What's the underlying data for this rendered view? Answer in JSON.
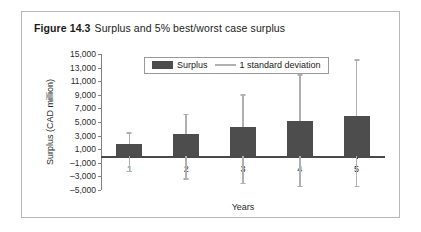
{
  "figure": {
    "number": "Figure 14.3",
    "title": "Surplus and 5% best/worst case surplus"
  },
  "colors": {
    "bar_fill": "#4d4d4d",
    "error_bar": "#b0b0b0",
    "axis": "#4a4a4a",
    "panel_border": "#b9b9b9",
    "text": "#1a1a1a"
  },
  "chart_data": {
    "type": "bar",
    "title": "Surplus and 5% best/worst case surplus",
    "xlabel": "Years",
    "ylabel": "Surplus (CAD million)",
    "categories": [
      "1",
      "2",
      "3",
      "4",
      "5"
    ],
    "ylim": [
      -5000,
      15000
    ],
    "ytick_labels": [
      "15,000",
      "13,000",
      "11,000",
      "9,000",
      "7,000",
      "5,000",
      "3,000",
      "1,000",
      "–1,000",
      "–3,000",
      "–5,000"
    ],
    "ytick_values": [
      15000,
      13000,
      11000,
      9000,
      7000,
      5000,
      3000,
      1000,
      -1000,
      -3000,
      -5000
    ],
    "ytick_step": 2000,
    "grid": false,
    "legend_position": "top-center",
    "series": [
      {
        "name": "Surplus",
        "type": "bar",
        "values": [
          1800,
          3200,
          4200,
          5100,
          5900
        ]
      },
      {
        "name": "1 standard deviation",
        "type": "errorbar",
        "upper": [
          3500,
          6200,
          9100,
          12000,
          14200
        ],
        "lower": [
          -2200,
          -3300,
          -3900,
          -4400,
          -4400
        ]
      }
    ],
    "legend": [
      {
        "label": "Surplus",
        "marker": "bar-swatch"
      },
      {
        "label": "1 standard deviation",
        "marker": "line-swatch"
      }
    ]
  }
}
